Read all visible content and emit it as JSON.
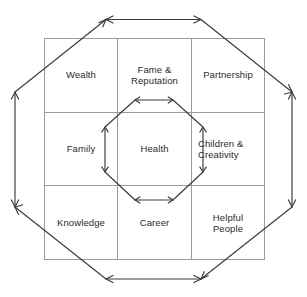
{
  "diagram": {
    "type": "feng-shui-bagua-grid",
    "grid": {
      "rows": 3,
      "columns": 3,
      "cells": [
        {
          "row": 0,
          "col": 0,
          "label": "Wealth"
        },
        {
          "row": 0,
          "col": 1,
          "label": "Fame &\nReputation"
        },
        {
          "row": 0,
          "col": 2,
          "label": "Partnership"
        },
        {
          "row": 1,
          "col": 0,
          "label": "Family"
        },
        {
          "row": 1,
          "col": 1,
          "label": "Health"
        },
        {
          "row": 1,
          "col": 2,
          "label": "Children &\nCreativity"
        },
        {
          "row": 2,
          "col": 0,
          "label": "Knowledge"
        },
        {
          "row": 2,
          "col": 1,
          "label": "Career"
        },
        {
          "row": 2,
          "col": 2,
          "label": "Helpful\nPeople"
        }
      ]
    },
    "shapes": {
      "outer_octagon_name": "outer-octagon",
      "inner_octagon_name": "inner-octagon",
      "grid_name": "three-by-three-grid"
    },
    "colors": {
      "background": "#ffffff",
      "grid_line": "#9a9a9a",
      "octagon_line": "#3a3a3a",
      "text": "#2b2b2b"
    }
  }
}
